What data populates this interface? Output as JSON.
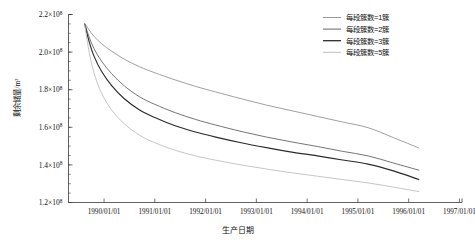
{
  "chart_data": {
    "type": "line",
    "title": "",
    "xlabel": "生产日期",
    "ylabel": "剩余储量/m³",
    "grid": false,
    "legend_position": "top-right",
    "xlim": [
      "1989/01/01",
      "1997/01/01"
    ],
    "ylim": [
      120000000.0,
      220000000.0
    ],
    "x_tick_labels": [
      "1990/01/01",
      "1991/01/01",
      "1992/01/01",
      "1993/01/01",
      "1994/01/01",
      "1995/01/01",
      "1996/01/01",
      "1997/01/01"
    ],
    "x_tick_values": [
      1990.0,
      1991.0,
      1992.0,
      1993.0,
      1994.0,
      1995.0,
      1996.0,
      1997.0
    ],
    "y_tick_labels": [
      "1.2×10⁸",
      "1.4×10⁸",
      "1.6×10⁸",
      "1.8×10⁸",
      "2.0×10⁸",
      "2.2×10⁸"
    ],
    "y_tick_mantissa": [
      "1.2",
      "1.4",
      "1.6",
      "1.8",
      "2.0",
      "2.2"
    ],
    "y_tick_exponent": "8",
    "y_tick_base": "×10",
    "y_tick_values": [
      120000000.0,
      140000000.0,
      160000000.0,
      180000000.0,
      200000000.0,
      220000000.0
    ],
    "x": [
      1989.62,
      1989.7,
      1989.8,
      1989.95,
      1990.15,
      1990.4,
      1990.7,
      1991.0,
      1991.4,
      1991.8,
      1992.2,
      1992.7,
      1993.2,
      1993.7,
      1994.2,
      1994.7,
      1995.2,
      1995.7,
      1996.2
    ],
    "series": [
      {
        "name": "每段簇数=1簇",
        "color": "#9a9a9a",
        "values": [
          215200000.0,
          212000000.0,
          208500000.0,
          204500000.0,
          200500000.0,
          196200000.0,
          192200000.0,
          189000000.0,
          185200000.0,
          181800000.0,
          178800000.0,
          175200000.0,
          171800000.0,
          168800000.0,
          165800000.0,
          162800000.0,
          159800000.0,
          154500000.0,
          149000000.0
        ]
      },
      {
        "name": "每段簇数=2簇",
        "color": "#6e6e6e",
        "values": [
          215000000.0,
          208500000.0,
          202000000.0,
          195200000.0,
          188500000.0,
          182000000.0,
          176200000.0,
          172200000.0,
          167800000.0,
          164200000.0,
          161200000.0,
          157800000.0,
          154800000.0,
          152200000.0,
          149800000.0,
          147200000.0,
          144800000.0,
          141000000.0,
          137200000.0
        ]
      },
      {
        "name": "每段簇数=3簇",
        "color": "#2b2b2b",
        "values": [
          214800000.0,
          206200000.0,
          198000000.0,
          189800000.0,
          182200000.0,
          175200000.0,
          169200000.0,
          165200000.0,
          160800000.0,
          157500000.0,
          154800000.0,
          151800000.0,
          149200000.0,
          146800000.0,
          144800000.0,
          142600000.0,
          140400000.0,
          136800000.0,
          132200000.0
        ]
      },
      {
        "name": "每段簇数=5簇",
        "color": "#c2c2c2",
        "values": [
          214500000.0,
          201000000.0,
          189200000.0,
          178200000.0,
          169200000.0,
          161800000.0,
          155800000.0,
          151800000.0,
          147800000.0,
          144800000.0,
          142500000.0,
          140000000.0,
          137800000.0,
          135800000.0,
          134000000.0,
          132200000.0,
          130400000.0,
          128200000.0,
          125800000.0
        ]
      }
    ]
  },
  "axes": {
    "y_title": "剩余储量/m³",
    "x_title": "生产日期"
  },
  "legend": {
    "items": [
      {
        "label": "每段簇数=1簇",
        "color": "#9a9a9a"
      },
      {
        "label": "每段簇数=2簇",
        "color": "#6e6e6e"
      },
      {
        "label": "每段簇数=3簇",
        "color": "#2b2b2b"
      },
      {
        "label": "每段簇数=5簇",
        "color": "#c2c2c2"
      }
    ]
  }
}
